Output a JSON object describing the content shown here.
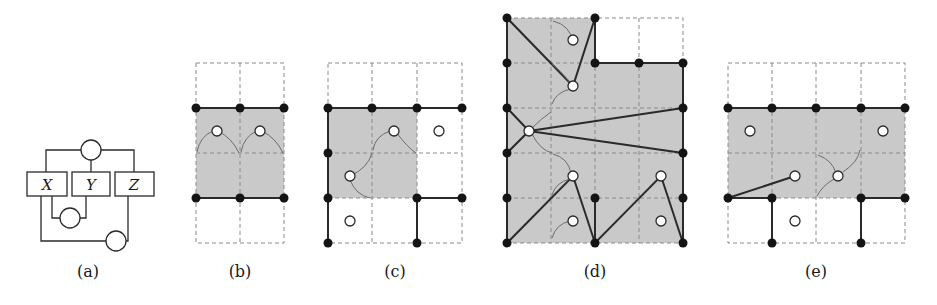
{
  "figure": {
    "panels": [
      {
        "id": "a",
        "label": "(a)",
        "type": "factor-graph",
        "variables": [
          "X",
          "Y",
          "Z"
        ],
        "factors": 3
      },
      {
        "id": "b",
        "label": "(b)",
        "type": "grid-tiling",
        "grid": {
          "cols": 2,
          "rows": 4
        }
      },
      {
        "id": "c",
        "label": "(c)",
        "type": "grid-tiling",
        "grid": {
          "cols": 3,
          "rows": 4
        }
      },
      {
        "id": "d",
        "label": "(d)",
        "type": "grid-tiling",
        "grid": {
          "cols": 4,
          "rows": 5
        }
      },
      {
        "id": "e",
        "label": "(e)",
        "type": "grid-tiling",
        "grid": {
          "cols": 4,
          "rows": 4
        }
      }
    ],
    "colors": {
      "fill": "#c9c9c9",
      "vertex": "#141414",
      "edge": "#2a2a2a",
      "grid": "#8a8a8a",
      "arc": "#6d6d6d"
    }
  }
}
